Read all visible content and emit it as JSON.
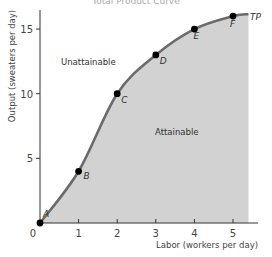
{
  "chart_data": {
    "type": "line",
    "title": "Total Product Curve",
    "xlabel": "Labor (workers per day)",
    "ylabel": "Output (sweaters per day)",
    "x_ticks": [
      "0",
      "1",
      "2",
      "3",
      "4",
      "5"
    ],
    "y_ticks": [
      "5",
      "10",
      "15"
    ],
    "xlim": [
      0,
      5.4
    ],
    "ylim": [
      0,
      16
    ],
    "grid": false,
    "curve_label": "TP",
    "regions": {
      "above": "Unattainable",
      "below": "Attainable"
    },
    "series": [
      {
        "name": "TP",
        "points": [
          {
            "label": "A",
            "x": 0,
            "y": 0
          },
          {
            "label": "B",
            "x": 1,
            "y": 4
          },
          {
            "label": "C",
            "x": 2,
            "y": 10
          },
          {
            "label": "D",
            "x": 3,
            "y": 13
          },
          {
            "label": "E",
            "x": 4,
            "y": 15
          },
          {
            "label": "F",
            "x": 5,
            "y": 16
          }
        ]
      }
    ],
    "colors": {
      "curve": "#6b6b6b",
      "fill": "#d2d2d2",
      "points": "#000000"
    }
  }
}
